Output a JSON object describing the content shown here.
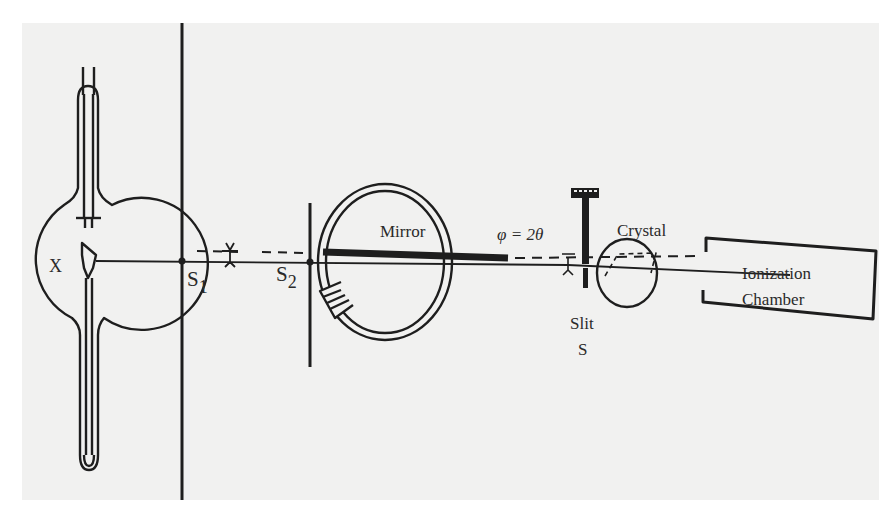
{
  "figure": {
    "colors": {
      "ink": "#1e1e1e",
      "paper": "#f1f1f0",
      "background": "#ffffff"
    },
    "labels": {
      "tube": "X",
      "slit1": "S",
      "slit1_sub": "1",
      "slit2": "S",
      "slit2_sub": "2",
      "mirror": "Mirror",
      "angle": "φ = 2θ",
      "crystal": "Crystal",
      "slit_name": "Slit",
      "slit_letter": "S",
      "detector_line1": "Ionization",
      "detector_line2": "Chamber"
    },
    "components": [
      {
        "name": "X-ray tube",
        "label": "X"
      },
      {
        "name": "first slit screen",
        "label": "S1"
      },
      {
        "name": "second slit screen",
        "label": "S2"
      },
      {
        "name": "mirror on rotating ring",
        "label": "Mirror"
      },
      {
        "name": "adjustable slit",
        "label": "Slit S"
      },
      {
        "name": "crystal",
        "label": "Crystal"
      },
      {
        "name": "ionization chamber",
        "label": "Ionization Chamber"
      }
    ]
  }
}
